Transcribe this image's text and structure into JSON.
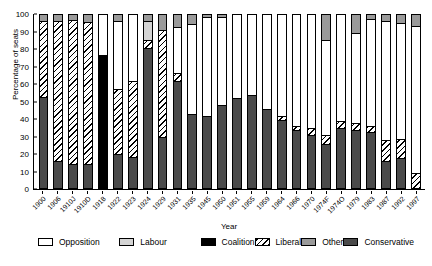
{
  "chart_data": {
    "type": "bar",
    "stacked": true,
    "title": "",
    "xlabel": "Year",
    "ylabel": "Percentage of seats",
    "ylim": [
      0,
      100
    ],
    "yticks": [
      0,
      10,
      20,
      30,
      40,
      50,
      60,
      70,
      80,
      90,
      100
    ],
    "grid": false,
    "legend_position": "bottom",
    "categories": [
      "1900",
      "1906",
      "1910J",
      "1910D",
      "1918",
      "1922",
      "1923",
      "1924",
      "1929",
      "1931",
      "1935",
      "1945",
      "1950",
      "1951",
      "1955",
      "1959",
      "1964",
      "1966",
      "1970",
      "1974F",
      "1974O",
      "1979",
      "1983",
      "1987",
      "1992",
      "1997"
    ],
    "series": [
      {
        "name": "Conservative",
        "color": "#4a4a4a",
        "values": [
          52,
          15,
          13.5,
          13.5,
          0,
          19,
          17.5,
          0,
          29,
          0,
          0,
          0,
          0,
          0,
          0,
          0,
          0,
          0,
          0,
          0,
          0,
          0,
          0,
          0,
          0,
          0
        ]
      },
      {
        "name": "Coalition",
        "color": "#000000",
        "values": [
          0,
          0,
          0,
          0,
          76.5,
          0,
          0,
          0,
          0,
          0,
          0,
          0,
          0,
          0,
          0,
          0,
          0,
          0,
          0,
          0,
          0,
          0,
          0,
          0,
          0,
          0
        ]
      },
      {
        "name": "Liberal",
        "color": "#ffffff",
        "hatch": "diagonal",
        "values": [
          45,
          81,
          83.5,
          83,
          0,
          37.5,
          45,
          0,
          32,
          0,
          0,
          0,
          0,
          0,
          0,
          0,
          0,
          0,
          0,
          0,
          0,
          0,
          0,
          0,
          0,
          0
        ]
      },
      {
        "name": "Labour",
        "color": "#d4d4d4",
        "values": [
          0,
          0,
          0,
          0,
          19,
          39,
          33.5,
          0,
          0,
          0,
          0,
          0,
          0,
          0,
          0,
          0,
          0,
          0,
          0,
          0,
          0,
          0,
          0,
          0,
          0,
          0
        ]
      },
      {
        "name": "Other",
        "color": "#9a9a9a",
        "values": [
          3,
          4,
          3,
          3.5,
          4.5,
          4.5,
          4,
          0,
          0,
          0,
          0,
          0,
          0,
          0,
          0,
          0,
          0,
          0,
          0,
          0,
          0,
          0,
          0,
          0,
          0,
          0
        ]
      }
    ],
    "bars": [
      {
        "year": "1900",
        "segments": [
          {
            "label": "Conservative",
            "value": 52
          },
          {
            "label": "Liberal",
            "value": 44
          },
          {
            "label": "Other",
            "value": 4
          }
        ]
      },
      {
        "year": "1906",
        "segments": [
          {
            "label": "Conservative",
            "value": 15
          },
          {
            "label": "Liberal",
            "value": 81
          },
          {
            "label": "Other",
            "value": 4
          }
        ]
      },
      {
        "year": "1910J",
        "segments": [
          {
            "label": "Conservative",
            "value": 13.5
          },
          {
            "label": "Liberal",
            "value": 83
          },
          {
            "label": "Other",
            "value": 3.5
          }
        ]
      },
      {
        "year": "1910D",
        "segments": [
          {
            "label": "Conservative",
            "value": 13.5
          },
          {
            "label": "Liberal",
            "value": 82
          },
          {
            "label": "Other",
            "value": 4.5
          }
        ]
      },
      {
        "year": "1918",
        "segments": [
          {
            "label": "Coalition",
            "value": 76.5
          },
          {
            "label": "Opposition",
            "value": 23.5
          }
        ]
      },
      {
        "year": "1922",
        "segments": [
          {
            "label": "Conservative",
            "value": 19
          },
          {
            "label": "Liberal",
            "value": 37.5
          },
          {
            "label": "Opposition",
            "value": 39.5
          },
          {
            "label": "Other",
            "value": 4
          }
        ]
      },
      {
        "year": "1923",
        "segments": [
          {
            "label": "Conservative",
            "value": 17.5
          },
          {
            "label": "Liberal",
            "value": 44
          },
          {
            "label": "Opposition",
            "value": 38.5
          }
        ]
      },
      {
        "year": "1924",
        "segments": [
          {
            "label": "Conservative",
            "value": 80.5
          },
          {
            "label": "Liberal",
            "value": 4.5
          },
          {
            "label": "Labour",
            "value": 11
          },
          {
            "label": "Other",
            "value": 4
          }
        ]
      },
      {
        "year": "1929",
        "segments": [
          {
            "label": "Conservative",
            "value": 29
          },
          {
            "label": "Liberal",
            "value": 62
          },
          {
            "label": "Other",
            "value": 9
          }
        ]
      },
      {
        "year": "1931",
        "segments": [
          {
            "label": "Conservative",
            "value": 61.5
          },
          {
            "label": "Liberal",
            "value": 4.5
          },
          {
            "label": "Opposition",
            "value": 26.5
          },
          {
            "label": "Other",
            "value": 7.5
          }
        ]
      },
      {
        "year": "1935",
        "segments": [
          {
            "label": "Conservative",
            "value": 42
          },
          {
            "label": "Opposition",
            "value": 52
          },
          {
            "label": "Other",
            "value": 6
          }
        ]
      },
      {
        "year": "1945",
        "segments": [
          {
            "label": "Conservative",
            "value": 41
          },
          {
            "label": "Opposition",
            "value": 57
          },
          {
            "label": "Other",
            "value": 2
          }
        ]
      },
      {
        "year": "1950",
        "segments": [
          {
            "label": "Conservative",
            "value": 47.5
          },
          {
            "label": "Opposition",
            "value": 51
          },
          {
            "label": "Other",
            "value": 1.5
          }
        ]
      },
      {
        "year": "1951",
        "segments": [
          {
            "label": "Conservative",
            "value": 51.5
          },
          {
            "label": "Opposition",
            "value": 48
          }
        ]
      },
      {
        "year": "1955",
        "segments": [
          {
            "label": "Conservative",
            "value": 53
          },
          {
            "label": "Opposition",
            "value": 47
          }
        ]
      },
      {
        "year": "1959",
        "segments": [
          {
            "label": "Conservative",
            "value": 45
          },
          {
            "label": "Opposition",
            "value": 55
          }
        ]
      },
      {
        "year": "1964",
        "segments": [
          {
            "label": "Conservative",
            "value": 39
          },
          {
            "label": "Liberal",
            "value": 2
          },
          {
            "label": "Opposition",
            "value": 59
          }
        ]
      },
      {
        "year": "1966",
        "segments": [
          {
            "label": "Conservative",
            "value": 33
          },
          {
            "label": "Liberal",
            "value": 2
          },
          {
            "label": "Opposition",
            "value": 65
          }
        ]
      },
      {
        "year": "1970",
        "segments": [
          {
            "label": "Conservative",
            "value": 30
          },
          {
            "label": "Liberal",
            "value": 4
          },
          {
            "label": "Opposition",
            "value": 66
          }
        ]
      },
      {
        "year": "1974F",
        "segments": [
          {
            "label": "Conservative",
            "value": 25
          },
          {
            "label": "Liberal",
            "value": 5
          },
          {
            "label": "Opposition",
            "value": 55
          },
          {
            "label": "Other",
            "value": 15
          }
        ]
      },
      {
        "year": "1974O",
        "segments": [
          {
            "label": "Conservative",
            "value": 34
          },
          {
            "label": "Liberal",
            "value": 4
          },
          {
            "label": "Opposition",
            "value": 62
          }
        ]
      },
      {
        "year": "1979",
        "segments": [
          {
            "label": "Conservative",
            "value": 33
          },
          {
            "label": "Liberal",
            "value": 4
          },
          {
            "label": "Opposition",
            "value": 52
          },
          {
            "label": "Other",
            "value": 11
          }
        ]
      },
      {
        "year": "1983",
        "segments": [
          {
            "label": "Conservative",
            "value": 32
          },
          {
            "label": "Liberal",
            "value": 3
          },
          {
            "label": "Opposition",
            "value": 62
          },
          {
            "label": "Other",
            "value": 3
          }
        ]
      },
      {
        "year": "1987",
        "segments": [
          {
            "label": "Conservative",
            "value": 15
          },
          {
            "label": "Liberal",
            "value": 12
          },
          {
            "label": "Opposition",
            "value": 69
          },
          {
            "label": "Other",
            "value": 4
          }
        ]
      },
      {
        "year": "1992",
        "segments": [
          {
            "label": "Conservative",
            "value": 17
          },
          {
            "label": "Liberal",
            "value": 11
          },
          {
            "label": "Opposition",
            "value": 67
          },
          {
            "label": "Other",
            "value": 5
          }
        ]
      },
      {
        "year": "1997",
        "segments": [
          {
            "label": "Liberal",
            "value": 8
          },
          {
            "label": "Opposition",
            "value": 85
          },
          {
            "label": "Other",
            "value": 7
          }
        ]
      }
    ],
    "legend": [
      {
        "label": "Opposition",
        "key": "opposition"
      },
      {
        "label": "Labour",
        "key": "labour"
      },
      {
        "label": "Coalition",
        "key": "coalition"
      },
      {
        "label": "Liberal",
        "key": "liberal"
      },
      {
        "label": "Other",
        "key": "other"
      },
      {
        "label": "Conservative",
        "key": "conservative"
      }
    ]
  }
}
